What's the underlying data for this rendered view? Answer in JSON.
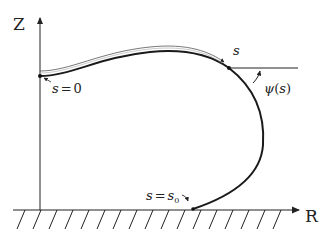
{
  "diagram": {
    "title": "",
    "axes": {
      "vertical_label": "Z",
      "horizontal_label": "R"
    },
    "labels": {
      "start_point": {
        "var": "s",
        "eq": "=",
        "value": "0"
      },
      "arc_length": "s",
      "tangent_angle": {
        "symbol": "ψ",
        "open": "(",
        "arg": "s",
        "close": ")"
      },
      "contact_point": {
        "var": "s",
        "eq": "=",
        "value": "s",
        "subscript": "0"
      }
    },
    "colors": {
      "curve": "#1a1a1a",
      "axis": "#222222",
      "background": "#ffffff"
    }
  }
}
